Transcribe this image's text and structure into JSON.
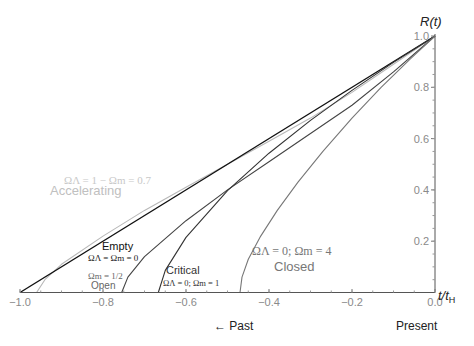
{
  "chart_data": {
    "type": "line",
    "title": "",
    "xlabel": "t/t_H",
    "ylabel": "R(t)",
    "xlim": [
      -1.0,
      0.0
    ],
    "ylim": [
      0.0,
      1.0
    ],
    "x_ticks": [
      "-1.0",
      "-0.8",
      "-0.6",
      "-0.4",
      "-0.2",
      "0.0"
    ],
    "y_ticks": [
      "0.2",
      "0.4",
      "0.6",
      "0.8",
      "1.0"
    ],
    "grid": false,
    "annotations": {
      "past": "← Past",
      "present": "Present"
    },
    "series": [
      {
        "name": "Accelerating",
        "params": "ΩΛ = 1 − Ωm = 0.7",
        "color": "#b8b8b8",
        "x": [
          -0.96,
          -0.94,
          -0.9,
          -0.8,
          -0.7,
          -0.6,
          -0.5,
          -0.4,
          -0.3,
          -0.2,
          -0.1,
          0.0
        ],
        "y": [
          0.0,
          0.05,
          0.11,
          0.22,
          0.32,
          0.41,
          0.5,
          0.59,
          0.68,
          0.78,
          0.89,
          1.0
        ]
      },
      {
        "name": "Empty",
        "params": "ΩΛ = Ωm = 0",
        "color": "#111111",
        "x": [
          -1.0,
          0.0
        ],
        "y": [
          0.0,
          1.0
        ]
      },
      {
        "name": "Open",
        "params": "Ωm = 1/2",
        "color": "#444444",
        "x": [
          -0.755,
          -0.74,
          -0.7,
          -0.6,
          -0.5,
          -0.4,
          -0.3,
          -0.2,
          -0.1,
          0.0
        ],
        "y": [
          0.0,
          0.06,
          0.14,
          0.28,
          0.4,
          0.51,
          0.62,
          0.73,
          0.86,
          1.0
        ]
      },
      {
        "name": "Critical",
        "params": "ΩΛ = 0; Ωm = 1",
        "color": "#333333",
        "x": [
          -0.6667,
          -0.65,
          -0.6,
          -0.5,
          -0.4,
          -0.3,
          -0.2,
          -0.1,
          0.0
        ],
        "y": [
          0.0,
          0.086,
          0.215,
          0.397,
          0.543,
          0.671,
          0.788,
          0.897,
          1.0
        ]
      },
      {
        "name": "Closed",
        "params": "ΩΛ = 0; Ωm = 4",
        "color": "#777777",
        "x": [
          -0.47,
          -0.465,
          -0.45,
          -0.42,
          -0.38,
          -0.33,
          -0.27,
          -0.2,
          -0.13,
          -0.06,
          0.0
        ],
        "y": [
          0.0,
          0.06,
          0.13,
          0.22,
          0.32,
          0.43,
          0.55,
          0.68,
          0.8,
          0.91,
          1.0
        ]
      }
    ]
  },
  "labels": {
    "ylabel_R": "R",
    "ylabel_t": "t",
    "xlabel_t": "t/t",
    "xlabel_sub": "H",
    "accel_params": "ΩΛ = 1 − Ωm = 0.7",
    "accel_name": "Accelerating",
    "empty_name": "Empty",
    "empty_params": "ΩΛ = Ωm = 0",
    "open_params": "Ωm = 1/2",
    "open_name": "Open",
    "critical_name": "Critical",
    "critical_params": "ΩΛ = 0; Ωm = 1",
    "closed_params": "ΩΛ = 0; Ωm = 4",
    "closed_name": "Closed",
    "past": "← Past",
    "present": "Present"
  }
}
